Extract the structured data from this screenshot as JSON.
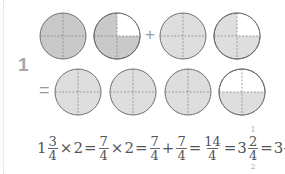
{
  "problem": {
    "number": "1",
    "row1": {
      "circles": [
        {
          "filled_quarters": 4,
          "shade": "#c9c9c9",
          "empty_quarter": null
        },
        {
          "filled_quarters": 3,
          "shade": "#c9c9c9",
          "empty_quarter": "top-right"
        },
        {
          "filled_quarters": 4,
          "shade": "#dedede",
          "empty_quarter": null
        },
        {
          "filled_quarters": 3,
          "shade": "#dedede",
          "empty_quarter": "top-right"
        }
      ],
      "operator": "+"
    },
    "row2": {
      "prefix": "=",
      "circles": [
        {
          "filled_quarters": 4,
          "shade": "#dedede"
        },
        {
          "filled_quarters": 4,
          "shade": "#dedede"
        },
        {
          "filled_quarters": 4,
          "shade": "#dedede"
        },
        {
          "filled_quarters": 2,
          "shade": "#dedede",
          "filled_half": "bottom"
        }
      ]
    },
    "equation": {
      "whole1": "1",
      "n1": "3",
      "d1": "4",
      "times1": "×",
      "two1": "2",
      "eq1": "=",
      "n2": "7",
      "d2": "4",
      "times2": "×",
      "two2": "2",
      "eq2": "=",
      "n3": "7",
      "d3": "4",
      "plus": "+",
      "n4": "7",
      "d4": "4",
      "eq3": "=",
      "n5": "14",
      "d5": "4",
      "eq4": "=",
      "whole6": "3",
      "n6": "2",
      "d6": "4",
      "n6_note": "1",
      "d6_note": "2",
      "eq5": "=",
      "whole7": "3",
      "n7": "1",
      "d7": "2"
    }
  },
  "colors": {
    "outline": "#6e6e6e",
    "dash": "#8a8a8a",
    "text": "#555555",
    "number": "#a8a8a8"
  }
}
